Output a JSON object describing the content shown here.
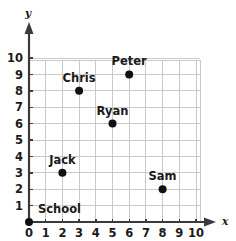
{
  "chart_data": {
    "type": "scatter",
    "title": "",
    "xlabel": "x",
    "ylabel": "y",
    "xlim": [
      0,
      10
    ],
    "ylim": [
      0,
      10
    ],
    "grid": true,
    "legend": "none",
    "x_ticks": [
      "0",
      "1",
      "2",
      "3",
      "4",
      "5",
      "6",
      "7",
      "8",
      "9",
      "10"
    ],
    "y_ticks": [
      "1",
      "2",
      "3",
      "4",
      "5",
      "6",
      "7",
      "8",
      "9",
      "10"
    ],
    "points": [
      {
        "label": "School",
        "x": 0,
        "y": 0,
        "label_pos": "right"
      },
      {
        "label": "Jack",
        "x": 2,
        "y": 3,
        "label_pos": "above"
      },
      {
        "label": "Chris",
        "x": 3,
        "y": 8,
        "label_pos": "above"
      },
      {
        "label": "Ryan",
        "x": 5,
        "y": 6,
        "label_pos": "above"
      },
      {
        "label": "Peter",
        "x": 6,
        "y": 9,
        "label_pos": "above"
      },
      {
        "label": "Sam",
        "x": 8,
        "y": 2,
        "label_pos": "above"
      }
    ]
  },
  "colors": {
    "grid": "#c9c9c9",
    "axis": "#3a3a3a",
    "point": "#111111",
    "text": "#1a1a1a",
    "background": "#ffffff"
  }
}
